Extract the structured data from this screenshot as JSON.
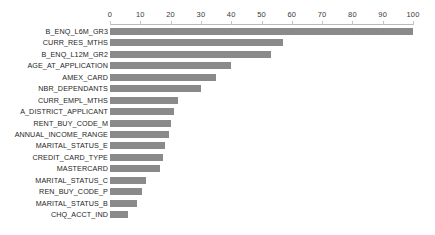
{
  "chart_data": {
    "type": "bar",
    "orientation": "horizontal",
    "title": "",
    "subtitle": "",
    "xlabel": "",
    "ylabel": "",
    "xlim": [
      0,
      100
    ],
    "ylim": null,
    "grid": false,
    "legend": null,
    "legend_position": "none",
    "bar_color": "#8a8a8a",
    "axis_position": "top",
    "xticks": [
      0,
      10,
      20,
      30,
      40,
      50,
      60,
      70,
      80,
      90,
      100
    ],
    "xticklabels": [
      "0",
      "10",
      "20",
      "30",
      "40",
      "50",
      "60",
      "70",
      "80",
      "90",
      "100"
    ],
    "categories": [
      "B_ENQ_L6M_GR3",
      "CURR_RES_MTHS",
      "B_ENQ_L12M_GR2",
      "AGE_AT_APPLICATION",
      "AMEX_CARD",
      "NBR_DEPENDANTS",
      "CURR_EMPL_MTHS",
      "A_DISTRICT_APPLICANT",
      "RENT_BUY_CODE_M",
      "ANNUAL_INCOME_RANGE",
      "MARITAL_STATUS_E",
      "CREDIT_CARD_TYPE",
      "MASTERCARD",
      "MARITAL_STATUS_C",
      "REN_BUY_CODE_P",
      "MARITAL_STATUS_B",
      "CHQ_ACCT_IND"
    ],
    "values": [
      100,
      57,
      53,
      40,
      35,
      30,
      22.5,
      21,
      20,
      19.5,
      18,
      17.5,
      16.5,
      12,
      10.5,
      9,
      6
    ]
  }
}
